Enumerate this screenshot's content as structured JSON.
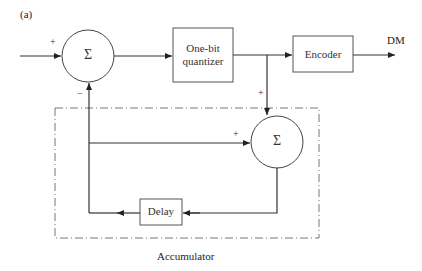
{
  "figure": {
    "panel_label": "(a)",
    "output_label": "DM",
    "group_label": "Accumulator"
  },
  "blocks": {
    "summer_main": {
      "symbol": "Σ",
      "input_signs": [
        "+",
        "−"
      ]
    },
    "quantizer": {
      "lines": [
        "One-bit",
        "quantizer"
      ]
    },
    "encoder": {
      "label": "Encoder"
    },
    "summer_accumulator": {
      "symbol": "Σ",
      "input_signs": [
        "+",
        "+"
      ]
    },
    "delay": {
      "label": "Delay"
    }
  },
  "colors": {
    "line": "#333333",
    "dashed_border": "#777777",
    "background": "#ffffff"
  }
}
